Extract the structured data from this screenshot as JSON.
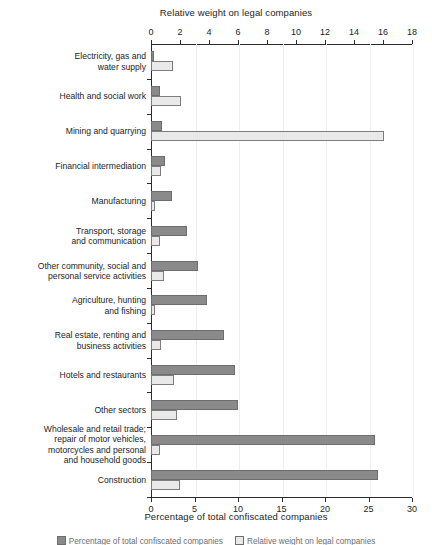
{
  "chart_data": {
    "type": "bar",
    "orientation": "horizontal",
    "title": "",
    "top_axis": {
      "label": "Relative weight on legal companies",
      "ticks": [
        0,
        2,
        4,
        6,
        8,
        10,
        12,
        14,
        16,
        18
      ],
      "range": [
        0,
        18
      ],
      "series": "Relative weight on legal companies"
    },
    "bottom_axis": {
      "label": "Percentage of total confiscated companies",
      "ticks": [
        0,
        5,
        10,
        15,
        20,
        25,
        30
      ],
      "range": [
        0,
        30
      ],
      "series": "Percentage of total confiscated companies"
    },
    "grid": false,
    "legend_position": "bottom",
    "categories": [
      "Electricity, gas and\nwater supply",
      "Health and social work",
      "Mining and quarrying",
      "Financial intermediation",
      "Manufacturing",
      "Transport, storage\nand communication",
      "Other community, social and\npersonal service activities",
      "Agriculture, hunting\nand fishing",
      "Real estate, renting and\nbusiness activities",
      "Hotels and restaurants",
      "Other sectors",
      "Wholesale and retail trade;\nrepair of motor vehicles,\nmotorcycles and personal\nand household goods",
      "Construction"
    ],
    "series": [
      {
        "name": "Percentage of total confiscated companies",
        "axis": "bottom",
        "color": "#8a8a8a",
        "values": [
          0.3,
          1.0,
          1.3,
          1.6,
          2.4,
          0.3,
          1.2,
          1.7,
          1.1,
          1.6,
          2.2,
          1.6,
          3.0
        ]
      },
      {
        "name": "Relative weight on legal companies",
        "axis": "top",
        "color": "#e9e9e9",
        "values": [
          1.5,
          2.1,
          16.1,
          0.7,
          0.3,
          0.6,
          0.9,
          0.25,
          0.7,
          1.6,
          1.8,
          0.6,
          2.0
        ]
      }
    ],
    "dark_bar_values_percentage": [
      0.3,
      1.0,
      1.3,
      1.6,
      2.4,
      4.1,
      5.4,
      6.4,
      8.4,
      9.6,
      10.0,
      25.7,
      26.1
    ],
    "light_bar_values_relweight": [
      1.5,
      2.1,
      16.1,
      0.7,
      0.3,
      0.6,
      0.9,
      0.25,
      0.7,
      1.6,
      1.8,
      0.6,
      2.0
    ],
    "legend": [
      {
        "swatch": "dark",
        "label": "Percentage of total confiscated companies"
      },
      {
        "swatch": "light",
        "label": "Relative weight on legal companies"
      }
    ]
  }
}
